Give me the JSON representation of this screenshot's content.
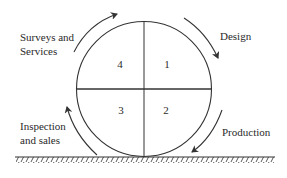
{
  "diagram": {
    "type": "cycle-wheel",
    "quadrants": [
      {
        "id": "q1",
        "number": "1",
        "position": "top-right"
      },
      {
        "id": "q2",
        "number": "2",
        "position": "bottom-right"
      },
      {
        "id": "q3",
        "number": "3",
        "position": "bottom-left"
      },
      {
        "id": "q4",
        "number": "4",
        "position": "top-left"
      }
    ],
    "stages": [
      {
        "label_lines": [
          "Design"
        ],
        "position": "top-right"
      },
      {
        "label_lines": [
          "Production"
        ],
        "position": "bottom-right"
      },
      {
        "label_lines": [
          "Inspection",
          "and sales"
        ],
        "position": "bottom-left"
      },
      {
        "label_lines": [
          "Surveys and",
          "Services"
        ],
        "position": "top-left"
      }
    ],
    "direction": "clockwise",
    "ground": "hatched-surface"
  },
  "colors": {
    "line": "#333333",
    "text": "#2a2a2a",
    "background": "#ffffff"
  }
}
